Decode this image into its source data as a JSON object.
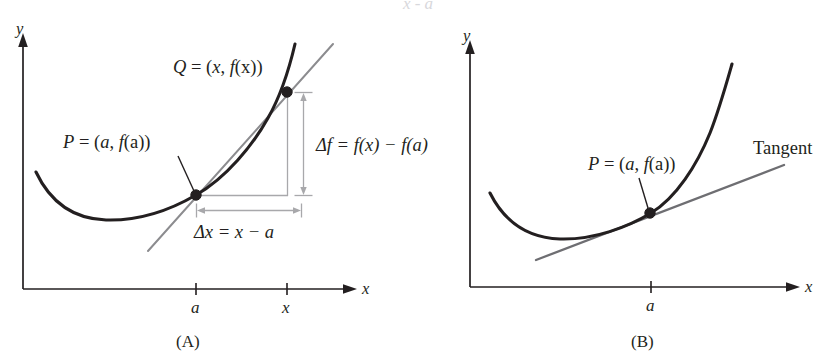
{
  "figure": {
    "type": "calculus-diagram",
    "background_color": "#ffffff",
    "ink_color": "#231f20",
    "secant_color": "#8c8c8f",
    "tangent_color": "#6e6e72",
    "dimension_color": "#a8a8ab",
    "clipped_top_text": "x - a"
  },
  "panel_a": {
    "caption": "(A)",
    "y_axis_label": "y",
    "x_axis_label": "x",
    "ticks": [
      {
        "name": "tick-a",
        "label": "a"
      },
      {
        "name": "tick-x",
        "label": "x"
      }
    ],
    "points": [
      {
        "name": "point-p",
        "label_q": "P",
        "label_eq": "= (",
        "label_full": "P = (a, f(a))"
      },
      {
        "name": "point-q",
        "label_full": "Q = (x, f(x))"
      }
    ],
    "label_p": {
      "sym": "P",
      "eq": " = (",
      "arg1": "a",
      "mid": ", ",
      "fn": "f",
      "arg2": "(a))"
    },
    "label_q": {
      "sym": "Q",
      "eq": " = (",
      "arg1": "x",
      "mid": ", ",
      "fn": "f",
      "arg2": "(x))"
    },
    "delta_f_label": "Δf = f(x) − f(a)",
    "delta_x_label": "Δx = x − a",
    "line_kind": "secant"
  },
  "panel_b": {
    "caption": "(B)",
    "y_axis_label": "y",
    "x_axis_label": "x",
    "ticks": [
      {
        "name": "tick-a",
        "label": "a"
      }
    ],
    "label_p": {
      "sym": "P",
      "eq": " = (",
      "arg1": "a",
      "mid": ", ",
      "fn": "f",
      "arg2": "(a))"
    },
    "label_p_full": "P = (a, f(a))",
    "tangent_label": "Tangent",
    "line_kind": "tangent"
  }
}
